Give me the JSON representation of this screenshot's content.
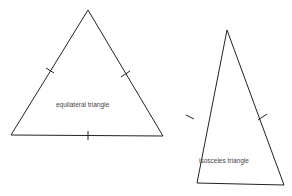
{
  "diagram": {
    "shapes": [
      {
        "id": "equilateral",
        "label": "equilateral triangle",
        "tick_marks": 3
      },
      {
        "id": "isosceles",
        "label": "isosceles triangle",
        "tick_marks": 2
      }
    ],
    "stroke_color": "#222222",
    "background": "#ffffff"
  }
}
